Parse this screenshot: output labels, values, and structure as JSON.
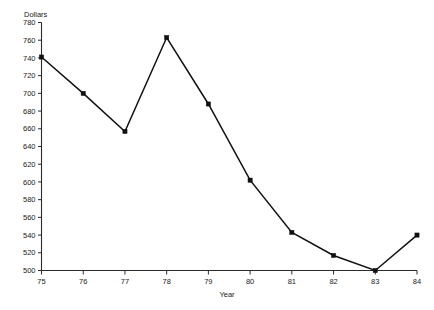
{
  "chart_data": {
    "type": "line",
    "title": "",
    "xlabel": "Year",
    "ylabel": "Dollars",
    "categories": [
      "75",
      "76",
      "77",
      "78",
      "79",
      "80",
      "81",
      "82",
      "83",
      "84"
    ],
    "x": [
      75,
      76,
      77,
      78,
      79,
      80,
      81,
      82,
      83,
      84
    ],
    "values": [
      741,
      700,
      657,
      763,
      688,
      602,
      543,
      517,
      500,
      540
    ],
    "series": [
      {
        "name": "Dollars",
        "values": [
          741,
          700,
          657,
          763,
          688,
          602,
          543,
          517,
          500,
          540
        ]
      }
    ],
    "xlim": [
      75,
      84
    ],
    "ylim": [
      500,
      780
    ],
    "ytick_step": 20,
    "yticks": [
      500,
      520,
      540,
      560,
      580,
      600,
      620,
      640,
      660,
      680,
      700,
      720,
      740,
      760,
      780
    ],
    "ytick_labels": [
      "500",
      "520",
      "540",
      "560",
      "580",
      "600",
      "620",
      "640",
      "660",
      "680",
      "700",
      "720",
      "740",
      "760",
      "780"
    ],
    "xticks": [
      75,
      76,
      77,
      78,
      79,
      80,
      81,
      82,
      83,
      84
    ],
    "xtick_labels": [
      "75",
      "76",
      "77",
      "78",
      "79",
      "80",
      "81",
      "82",
      "83",
      "84"
    ],
    "grid": false,
    "legend": false,
    "marker": "square",
    "line_color": "#111111",
    "marker_color": "#111111",
    "axis_color": "#2b2b2b",
    "background": "#ffffff"
  },
  "axis": {
    "y_title": "Dollars",
    "x_title": "Year"
  }
}
